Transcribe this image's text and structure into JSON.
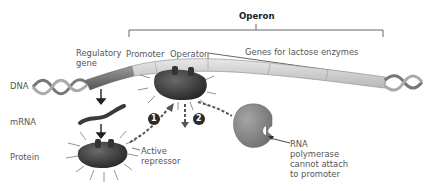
{
  "diagram": {
    "title": "Operon",
    "labels": {
      "regulatory_gene": "Regulatory gene",
      "promoter": "Promoter",
      "operator": "Operator",
      "genes_lactose": "Genes for lactose enzymes",
      "dna": "DNA",
      "mrna": "mRNA",
      "protein": "Protein",
      "active_repressor": "Active repressor",
      "rna_polymerase": "RNA polymerase cannot attach to promoter"
    },
    "steps": [
      "1",
      "2"
    ],
    "colors": {
      "dna_dark": "#6e6e6e",
      "dna_light": "#d9d9d9",
      "repressor": "#3f3f3f",
      "polymerase": "#8a8a8a",
      "step_badge": "#2b2b2b"
    }
  }
}
